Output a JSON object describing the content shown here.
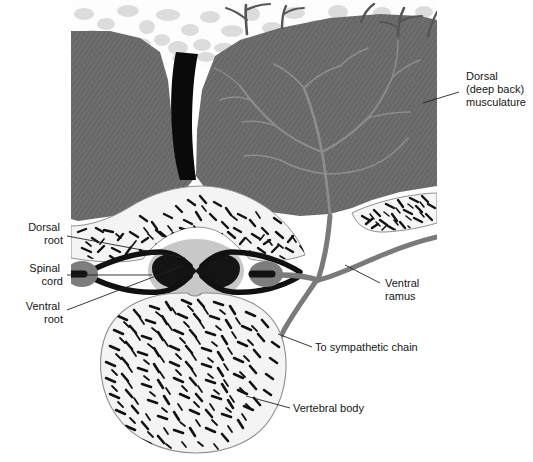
{
  "figure": {
    "width": 533,
    "height": 462,
    "background": "#ffffff"
  },
  "colors": {
    "muscle": "#6e6e6e",
    "muscle_hatch": "#5c5c5c",
    "fat_background": "#fcfcfc",
    "fat_cell": "#dcdcdc",
    "bone_fill": "#f2f2f2",
    "bone_outline": "#8a8a8a",
    "trabecula": "#111111",
    "nerve_dark": "#111111",
    "nerve_gray": "#777777",
    "ganglion": "#808080",
    "cord_white_matter": "#c8c8c8",
    "cord_gray_matter": "#141414",
    "raphe_black": "#080808",
    "label_text": "#161616",
    "leader_line": "#222222"
  },
  "labels": [
    {
      "id": "dorsal-musculature",
      "lines": [
        "Dorsal",
        "(deep back)",
        "musculature"
      ],
      "text_x": 466,
      "text_y": 80,
      "anchor": "start",
      "leader": {
        "x1": 423,
        "y1": 103,
        "x2": 459,
        "y2": 92
      }
    },
    {
      "id": "dorsal-root",
      "lines": [
        "Dorsal",
        "root"
      ],
      "text_x": 63,
      "text_y": 231,
      "anchor": "end",
      "leader": {
        "x1": 67,
        "y1": 236,
        "x2": 185,
        "y2": 258
      }
    },
    {
      "id": "spinal-cord",
      "lines": [
        "Spinal",
        "cord"
      ],
      "text_x": 63,
      "text_y": 272,
      "anchor": "end",
      "leader": {
        "x1": 67,
        "y1": 277,
        "x2": 152,
        "y2": 276
      }
    },
    {
      "id": "ventral-root",
      "lines": [
        "Ventral",
        "root"
      ],
      "text_x": 63,
      "text_y": 310,
      "anchor": "end",
      "leader": {
        "x1": 67,
        "y1": 310,
        "x2": 182,
        "y2": 265
      }
    },
    {
      "id": "ventral-ramus",
      "lines": [
        "Ventral",
        "ramus"
      ],
      "text_x": 385,
      "text_y": 287,
      "anchor": "start",
      "leader": {
        "x1": 345,
        "y1": 265,
        "x2": 380,
        "y2": 283
      }
    },
    {
      "id": "to-sympathetic-chain",
      "lines": [
        "To sympathetic chain"
      ],
      "text_x": 315,
      "text_y": 351,
      "anchor": "start",
      "leader": {
        "x1": 278,
        "y1": 334,
        "x2": 312,
        "y2": 347
      }
    },
    {
      "id": "vertebral-body",
      "lines": [
        "Vertebral body"
      ],
      "text_x": 293,
      "text_y": 412,
      "anchor": "start",
      "leader": {
        "x1": 246,
        "y1": 396,
        "x2": 290,
        "y2": 408
      }
    }
  ],
  "structures": {
    "subcutaneous_fat": "fat layer with lobular adipose cells",
    "deep_back_muscle_left": "left erector spinae mass, hatched",
    "deep_back_muscle_right": "right erector spinae mass, hatched",
    "midline_raphe": "black midline cleft over spinous process",
    "vertebral_arch": "lamina with trabecular bone",
    "transverse_process": "lateral bone island with trabecular bone",
    "vertebral_body": "large anterior bone mass with trabecular bone",
    "spinal_cord": "oval white matter with butterfly gray matter",
    "dorsal_root_ganglion_left": "left ganglion swelling",
    "dorsal_root_ganglion_right": "right ganglion swelling",
    "dorsal_ramus_branches": "nerve tree branching through dorsal muscle",
    "cutaneous_branches": "nerve twigs entering subcutaneous fat",
    "ventral_ramus": "nerve running laterally beneath muscle",
    "sympathetic_branch": "nerve descending around vertebral body"
  }
}
